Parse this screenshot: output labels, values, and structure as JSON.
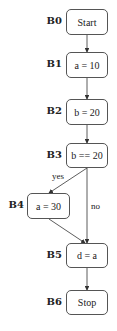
{
  "diagram": {
    "type": "control-flow-graph",
    "nodes": [
      {
        "id": "B0",
        "label": "Start"
      },
      {
        "id": "B1",
        "label": "a = 10"
      },
      {
        "id": "B2",
        "label": "b = 20"
      },
      {
        "id": "B3",
        "label": "b == 20"
      },
      {
        "id": "B4",
        "label": "a = 30"
      },
      {
        "id": "B5",
        "label": "d = a"
      },
      {
        "id": "B6",
        "label": "Stop"
      }
    ],
    "edges": [
      {
        "from": "B0",
        "to": "B1",
        "label": ""
      },
      {
        "from": "B1",
        "to": "B2",
        "label": ""
      },
      {
        "from": "B2",
        "to": "B3",
        "label": ""
      },
      {
        "from": "B3",
        "to": "B4",
        "label": "yes"
      },
      {
        "from": "B3",
        "to": "B5",
        "label": "no"
      },
      {
        "from": "B4",
        "to": "B5",
        "label": ""
      },
      {
        "from": "B5",
        "to": "B6",
        "label": ""
      }
    ]
  }
}
